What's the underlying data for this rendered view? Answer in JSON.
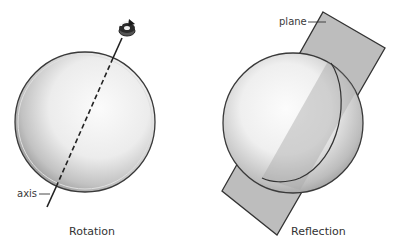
{
  "panels": [
    {
      "id": "rotation",
      "caption": "Rotation",
      "callout_label": "axis",
      "elements": [
        "sphere",
        "dashed axis through sphere",
        "curved rotation arrow at top of axis"
      ]
    },
    {
      "id": "reflection",
      "caption": "Reflection",
      "callout_label": "plane",
      "elements": [
        "sphere",
        "rectangular plane cutting through sphere"
      ]
    }
  ],
  "colors": {
    "outline": "#3a3a3a",
    "sphere_light": "#f6f6f6",
    "sphere_shade": "#a9a9a9",
    "plane_fill": "#b9b9b9",
    "axis": "#222222"
  },
  "icons": {
    "rotation_arrow": "rotate-arrow-icon"
  }
}
